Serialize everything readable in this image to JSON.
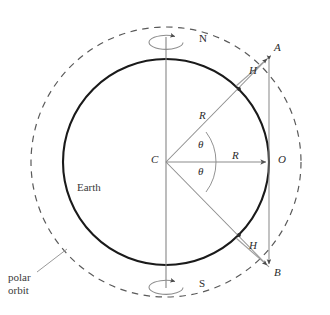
{
  "figure": {
    "type": "geometry-diagram",
    "background_color": "#ffffff",
    "earth_stroke": "#1a1a1a",
    "orbit_stroke": "#5a5a5a",
    "construction_stroke": "#8c8c8c",
    "axis_stroke": "#8c8c8c",
    "label_color": "#2b2b2b"
  },
  "labels": {
    "north_pole": "N",
    "south_pole": "S",
    "center": "C",
    "observer": "O",
    "point_a": "A",
    "point_b": "B",
    "horizon_upper": "H",
    "horizon_lower": "H",
    "radius_diagonal": "R",
    "radius_equator": "R",
    "theta_upper": "θ",
    "theta_lower": "θ",
    "earth": "Earth",
    "orbit_line1": "polar",
    "orbit_line2": "orbit"
  },
  "geometry": {
    "center": {
      "x": 166,
      "y": 162
    },
    "earth_radius": 103,
    "orbit_radius": 135,
    "theta_degrees": 37,
    "vertical_chord_x": 269,
    "point_a": {
      "x": 269,
      "y": 56
    },
    "point_b": {
      "x": 269,
      "y": 268
    },
    "point_o": {
      "x": 269,
      "y": 162
    },
    "horizon_upper": {
      "x": 248,
      "y": 100
    },
    "horizon_lower": {
      "x": 248,
      "y": 224
    }
  },
  "annotations": {
    "rotation_arrows": 2,
    "dashed_circle": "polar orbit",
    "solid_circle": "Earth surface"
  }
}
